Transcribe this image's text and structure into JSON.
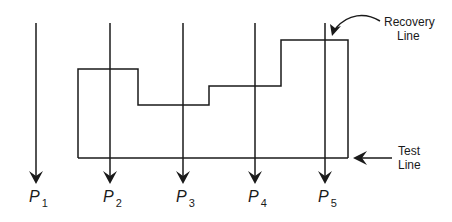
{
  "diagram": {
    "processes": [
      {
        "name": "P",
        "sub": "1",
        "x": 36
      },
      {
        "name": "P",
        "sub": "2",
        "x": 110
      },
      {
        "name": "P",
        "sub": "3",
        "x": 183
      },
      {
        "name": "P",
        "sub": "4",
        "x": 255
      },
      {
        "name": "P",
        "sub": "5",
        "x": 325
      }
    ],
    "recovery_label": {
      "line1": "Recovery",
      "line2": "Line"
    },
    "test_label": {
      "line1": "Test",
      "line2": "Line"
    },
    "colors": {
      "stroke": "#1a1a1a",
      "background": "#ffffff"
    }
  }
}
